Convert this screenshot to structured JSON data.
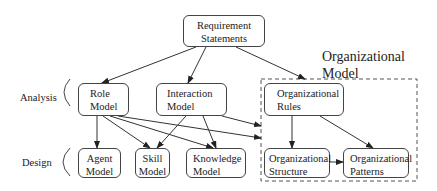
{
  "diagram": {
    "group": {
      "title_line1": "Organizational",
      "title_line2": "Model"
    },
    "phases": {
      "analysis": "Analysis",
      "design": "Design"
    },
    "nodes": {
      "requirements": {
        "line1": "Requirement",
        "line2": "Statements"
      },
      "role": {
        "line1": "Role",
        "line2": "Model"
      },
      "interaction": {
        "line1": "Interaction",
        "line2": "Model"
      },
      "org_rules": {
        "line1": "Organizational",
        "line2": "Rules"
      },
      "agent": {
        "line1": "Agent",
        "line2": "Model"
      },
      "skill": {
        "line1": "Skill",
        "line2": "Model"
      },
      "knowledge": {
        "line1": "Knowledge",
        "line2": "Model"
      },
      "org_structure": {
        "line1": "Organizational",
        "line2": "Structure"
      },
      "org_patterns": {
        "line1": "Organizational",
        "line2": "Patterns"
      }
    },
    "edges": [
      {
        "from": "Requirement Statements",
        "to": "Role Model"
      },
      {
        "from": "Requirement Statements",
        "to": "Interaction Model"
      },
      {
        "from": "Requirement Statements",
        "to": "Organizational Model"
      },
      {
        "from": "Role Model",
        "to": "Agent Model"
      },
      {
        "from": "Role Model",
        "to": "Skill Model"
      },
      {
        "from": "Role Model",
        "to": "Knowledge Model"
      },
      {
        "from": "Role Model",
        "to": "Organizational Structure"
      },
      {
        "from": "Interaction Model",
        "to": "Skill Model"
      },
      {
        "from": "Interaction Model",
        "to": "Knowledge Model"
      },
      {
        "from": "Interaction Model",
        "to": "Organizational Structure"
      },
      {
        "from": "Organizational Rules",
        "to": "Organizational Structure"
      },
      {
        "from": "Organizational Rules",
        "to": "Organizational Patterns"
      },
      {
        "from": "Organizational Structure",
        "to": "Organizational Patterns"
      }
    ]
  }
}
